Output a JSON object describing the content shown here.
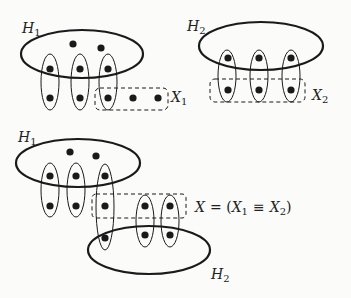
{
  "diagram": {
    "colors": {
      "stroke": "#1a1a1a",
      "dot": "#1a1a1a",
      "background": "#fbfbfa"
    },
    "panels": [
      {
        "id": "top-left",
        "hyperedge_label": {
          "main": "H",
          "sub": "1"
        },
        "set_label": {
          "main": "X",
          "sub": "1"
        }
      },
      {
        "id": "top-right",
        "hyperedge_label": {
          "main": "H",
          "sub": "2"
        },
        "set_label": {
          "main": "X",
          "sub": "2"
        }
      },
      {
        "id": "bottom",
        "hyperedge_label_1": {
          "main": "H",
          "sub": "1"
        },
        "hyperedge_label_2": {
          "main": "H",
          "sub": "2"
        },
        "set_label": {
          "main": "X",
          "equals": "= (",
          "x1_main": "X",
          "x1_sub": "1",
          "equiv": "≡",
          "x2_main": "X",
          "x2_sub": "2",
          "close": ")"
        }
      }
    ]
  }
}
